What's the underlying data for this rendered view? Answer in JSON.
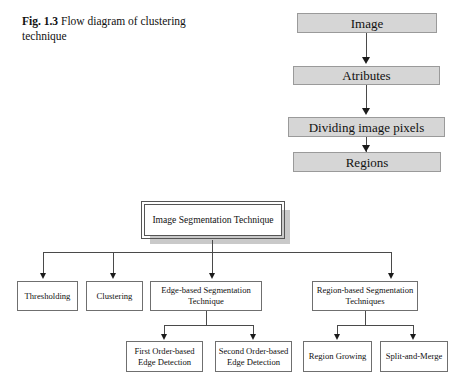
{
  "figure": {
    "caption_label": "Fig. 1.3",
    "caption_text": "Flow diagram of clustering technique",
    "colors": {
      "flow_box_fill": "#d6d6d6",
      "flow_box_border": "#9a9a9a",
      "tree_box_fill": "#ffffff",
      "tree_box_border": "#6f6f6f",
      "connector": "#4a4a4a",
      "shadow": "#c9c9c9",
      "text": "#111111",
      "page_background": "#ffffff"
    }
  },
  "flow_chain": {
    "title": "Image segmentation flow",
    "steps": [
      {
        "id": "image",
        "label": "Image"
      },
      {
        "id": "attributes",
        "label": "Atributes"
      },
      {
        "id": "dividing-image-pixels",
        "label": "Dividing image pixels"
      },
      {
        "id": "regions",
        "label": "Regions"
      }
    ]
  },
  "tree": {
    "root": {
      "id": "image-segmentation-technique",
      "label": "Image Segmentation Technique"
    },
    "level1": [
      {
        "id": "thresholding",
        "label": "Thresholding"
      },
      {
        "id": "clustering",
        "label": "Clustering"
      },
      {
        "id": "edge-based-segmentation-technique",
        "label": "Edge-based Segmentation Technique"
      },
      {
        "id": "region-based-segmentation-techniques",
        "label": "Region-based Segmentation Techniques"
      }
    ],
    "level2_edge": [
      {
        "id": "first-order-based-edge-detection",
        "label": "First Order-based Edge Detection"
      },
      {
        "id": "second-order-based-edge-detection",
        "label": "Second Order-based Edge Detection"
      }
    ],
    "level2_region": [
      {
        "id": "region-growing",
        "label": "Region Growing"
      },
      {
        "id": "split-and-merge",
        "label": "Split-and-Merge"
      }
    ]
  }
}
